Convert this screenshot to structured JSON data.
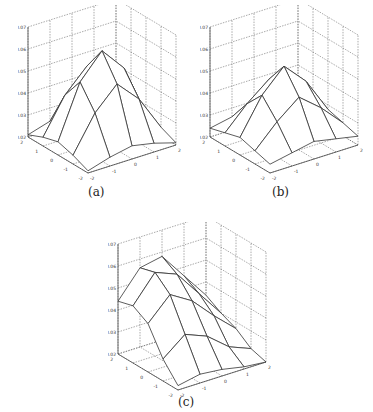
{
  "chart_data": [
    {
      "type": "surface",
      "panel": "a",
      "caption": "(a)",
      "x": [
        -2,
        -1,
        0,
        1,
        2
      ],
      "y": [
        -2,
        -1,
        0,
        1,
        2
      ],
      "zlim": [
        0.02,
        0.07
      ],
      "zticks": [
        "0.02",
        "0.03",
        "0.04",
        "0.05",
        "0.06",
        "0.07"
      ],
      "xticks": [
        "-2",
        "-1",
        "0",
        "1",
        "2"
      ],
      "yticks": [
        "-2",
        "-1",
        "0",
        "1",
        "2"
      ],
      "z": [
        [
          0.021,
          0.024,
          0.026,
          0.024,
          0.021
        ],
        [
          0.024,
          0.04,
          0.05,
          0.04,
          0.024
        ],
        [
          0.026,
          0.05,
          0.061,
          0.05,
          0.026
        ],
        [
          0.024,
          0.04,
          0.05,
          0.04,
          0.024
        ],
        [
          0.021,
          0.024,
          0.026,
          0.024,
          0.021
        ]
      ]
    },
    {
      "type": "surface",
      "panel": "b",
      "caption": "(b)",
      "x": [
        -2,
        -1,
        0,
        1,
        2
      ],
      "y": [
        -2,
        -1,
        0,
        1,
        2
      ],
      "zlim": [
        0.02,
        0.07
      ],
      "zticks": [
        "0.02",
        "0.03",
        "0.04",
        "0.05",
        "0.06",
        "0.07"
      ],
      "xticks": [
        "-2",
        "-1",
        "0",
        "1",
        "2"
      ],
      "yticks": [
        "-2",
        "-1",
        "0",
        "1",
        "2"
      ],
      "z": [
        [
          0.024,
          0.026,
          0.028,
          0.026,
          0.024
        ],
        [
          0.026,
          0.036,
          0.044,
          0.036,
          0.026
        ],
        [
          0.028,
          0.044,
          0.054,
          0.044,
          0.028
        ],
        [
          0.026,
          0.036,
          0.044,
          0.036,
          0.026
        ],
        [
          0.024,
          0.026,
          0.028,
          0.026,
          0.024
        ]
      ]
    },
    {
      "type": "surface",
      "panel": "c",
      "caption": "(c)",
      "x": [
        -2,
        -1,
        0,
        1,
        2
      ],
      "y": [
        -2,
        -1,
        0,
        1,
        2
      ],
      "zlim": [
        0.02,
        0.07
      ],
      "zticks": [
        "0.02",
        "0.03",
        "0.04",
        "0.05",
        "0.06",
        "0.07"
      ],
      "xticks": [
        "-2",
        "-1",
        "0",
        "1",
        "2"
      ],
      "yticks": [
        "-2",
        "-1",
        "0",
        "1",
        "2"
      ],
      "z": [
        [
          0.022,
          0.024,
          0.023,
          0.021,
          0.02
        ],
        [
          0.03,
          0.038,
          0.034,
          0.026,
          0.022
        ],
        [
          0.042,
          0.052,
          0.046,
          0.036,
          0.027
        ],
        [
          0.046,
          0.058,
          0.054,
          0.042,
          0.03
        ],
        [
          0.044,
          0.056,
          0.058,
          0.046,
          0.034
        ]
      ]
    }
  ]
}
